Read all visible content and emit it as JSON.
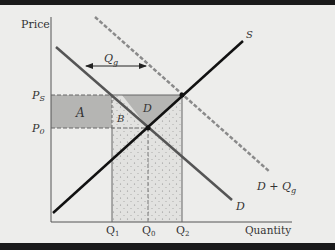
{
  "diagram": {
    "title": "",
    "axes": {
      "y_label": "Price",
      "x_label": "Quantity"
    },
    "price_ticks": [
      {
        "id": "ps",
        "main": "P",
        "sub": "S"
      },
      {
        "id": "p0",
        "main": "P",
        "sub": "0"
      }
    ],
    "quantity_ticks": [
      {
        "id": "q1",
        "main": "Q",
        "sub": "1"
      },
      {
        "id": "q0",
        "main": "Q",
        "sub": "0"
      },
      {
        "id": "q2",
        "main": "Q",
        "sub": "2"
      }
    ],
    "curves": {
      "supply": {
        "label": "S",
        "color": "#111111",
        "style": "solid"
      },
      "demand": {
        "label": "D",
        "color": "#555555",
        "style": "solid"
      },
      "demand_plus_gov": {
        "label_main": "D + Q",
        "label_sub": "g",
        "color": "#8a8a8a",
        "style": "dashed"
      }
    },
    "gov_purchase_arrow": {
      "main": "Q",
      "sub": "g"
    },
    "regions": {
      "A": {
        "label": "A",
        "fill": "#b3b3b1"
      },
      "B": {
        "label": "B",
        "fill": "#dcdcda"
      },
      "D": {
        "label": "D",
        "fill": "#b3b3b1"
      },
      "stippled": {
        "fill": "#dedede"
      }
    },
    "colors": {
      "background": "#ededeb",
      "frame_bar": "#1a1a1a",
      "axis": "#555555"
    }
  }
}
